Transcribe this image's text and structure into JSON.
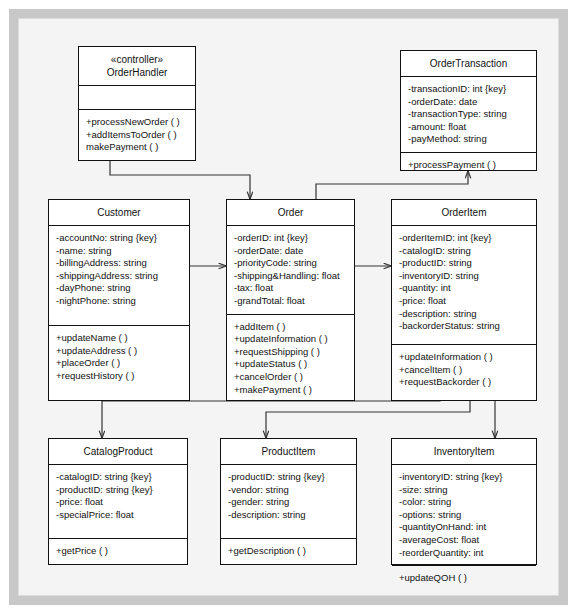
{
  "diagram": {
    "type": "uml-class-diagram",
    "colors": {
      "page_background": "#ffffff",
      "frame_border": "#c8c8c8",
      "canvas_background": "#f4f4f4",
      "class_border": "#111111",
      "class_fill": "#ffffff",
      "connector": "#333333",
      "text": "#111111"
    }
  },
  "classes": [
    {
      "id": "order-handler",
      "stereotype": "«controller»",
      "name": "OrderHandler",
      "name_block": "«controller»\nOrderHandler",
      "attributes": [],
      "attributes_block": "",
      "operations": [
        "+processNewOrder ( )",
        "+addItemsToOrder ( )",
        "makePayment ( )"
      ],
      "operations_block": "+processNewOrder ( )\n+addItemsToOrder ( )\nmakePayment ( )"
    },
    {
      "id": "order-transaction",
      "stereotype": "",
      "name": "OrderTransaction",
      "name_block": "OrderTransaction",
      "attributes": [
        "-transactionID: int {key}",
        "-orderDate: date",
        "-transactionType: string",
        "-amount: float",
        "-payMethod: string"
      ],
      "attributes_block": "-transactionID: int {key}\n-orderDate: date\n-transactionType: string\n-amount: float\n-payMethod: string",
      "operations": [
        "+processPayment ( )"
      ],
      "operations_block": "+processPayment ( )"
    },
    {
      "id": "customer",
      "stereotype": "",
      "name": "Customer",
      "name_block": "Customer",
      "attributes": [
        "-accountNo: string {key}",
        "-name: string",
        "-billingAddress: string",
        "-shippingAddress: string",
        "-dayPhone: string",
        "-nightPhone: string"
      ],
      "attributes_block": "-accountNo: string {key}\n-name: string\n-billingAddress: string\n-shippingAddress: string\n-dayPhone: string\n-nightPhone: string",
      "operations": [
        "+updateName ( )",
        "+updateAddress ( )",
        "+placeOrder ( )",
        "+requestHistory ( )"
      ],
      "operations_block": "+updateName ( )\n+updateAddress ( )\n+placeOrder ( )\n+requestHistory ( )"
    },
    {
      "id": "order",
      "stereotype": "",
      "name": "Order",
      "name_block": "Order",
      "attributes": [
        "-orderID: int {key}",
        "-orderDate: date",
        "-priorityCode: string",
        "-shipping&Handling: float",
        "-tax: float",
        "-grandTotal: float"
      ],
      "attributes_block": "-orderID: int {key}\n-orderDate: date\n-priorityCode: string\n-shipping&Handling: float\n-tax: float\n-grandTotal: float",
      "operations": [
        "+addItem ( )",
        "+updateInformation ( )",
        "+requestShipping ( )",
        "+updateStatus ( )",
        "+cancelOrder ( )",
        "+makePayment ( )"
      ],
      "operations_block": "+addItem ( )\n+updateInformation ( )\n+requestShipping ( )\n+updateStatus ( )\n+cancelOrder ( )\n+makePayment ( )"
    },
    {
      "id": "order-item",
      "stereotype": "",
      "name": "OrderItem",
      "name_block": "OrderItem",
      "attributes": [
        "-orderItemID: int {key}",
        "-catalogID: string",
        "-productID: string",
        "-inventoryID: string",
        "-quantity: int",
        "-price: float",
        "-description: string",
        "-backorderStatus: string"
      ],
      "attributes_block": "-orderItemID: int {key}\n-catalogID: string\n-productID: string\n-inventoryID: string\n-quantity: int\n-price: float\n-description: string\n-backorderStatus: string",
      "operations": [
        "+updateInformation ( )",
        "+cancelItem ( )",
        "+requestBackorder ( )"
      ],
      "operations_block": "+updateInformation ( )\n+cancelItem ( )\n+requestBackorder ( )"
    },
    {
      "id": "catalog-product",
      "stereotype": "",
      "name": "CatalogProduct",
      "name_block": "CatalogProduct",
      "attributes": [
        "-catalogID: string {key}",
        "-productID: string {key}",
        "-price: float",
        "-specialPrice: float"
      ],
      "attributes_block": "-catalogID: string {key}\n-productID: string {key}\n-price: float\n-specialPrice: float",
      "operations": [
        "+getPrice ( )"
      ],
      "operations_block": "+getPrice ( )"
    },
    {
      "id": "product-item",
      "stereotype": "",
      "name": "ProductItem",
      "name_block": "ProductItem",
      "attributes": [
        "-productID: string {key}",
        "-vendor: string",
        "-gender: string",
        "-description: string"
      ],
      "attributes_block": "-productID: string {key}\n-vendor: string\n-gender: string\n-description: string",
      "operations": [
        "+getDescription ( )"
      ],
      "operations_block": "+getDescription ( )"
    },
    {
      "id": "inventory-item",
      "stereotype": "",
      "name": "InventoryItem",
      "name_block": "InventoryItem",
      "attributes": [
        "-inventoryID: string {key}",
        "-size: string",
        "-color: string",
        "-options: string",
        "-quantityOnHand: int",
        "-averageCost: float",
        "-reorderQuantity: int"
      ],
      "attributes_block": "-inventoryID: string {key}\n-size: string\n-color: string\n-options: string\n-quantityOnHand: int\n-averageCost: float\n-reorderQuantity: int",
      "operations": [
        "+updateQOH ( )"
      ],
      "operations_block": "+updateQOH ( )"
    }
  ],
  "connections": [
    {
      "id": "handler-to-order",
      "from": "order-handler",
      "to": "order",
      "arrow": "open"
    },
    {
      "id": "order-to-transaction",
      "from": "order",
      "to": "order-transaction",
      "arrow": "open"
    },
    {
      "id": "customer-to-order",
      "from": "customer",
      "to": "order",
      "arrow": "open"
    },
    {
      "id": "order-to-orderitem",
      "from": "order",
      "to": "order-item",
      "arrow": "open"
    },
    {
      "id": "orderitem-to-catalogproduct",
      "from": "order-item",
      "to": "catalog-product",
      "arrow": "open"
    },
    {
      "id": "orderitem-to-productitem",
      "from": "order-item",
      "to": "product-item",
      "arrow": "open"
    },
    {
      "id": "orderitem-to-inventoryitem",
      "from": "order-item",
      "to": "inventory-item",
      "arrow": "open"
    }
  ]
}
